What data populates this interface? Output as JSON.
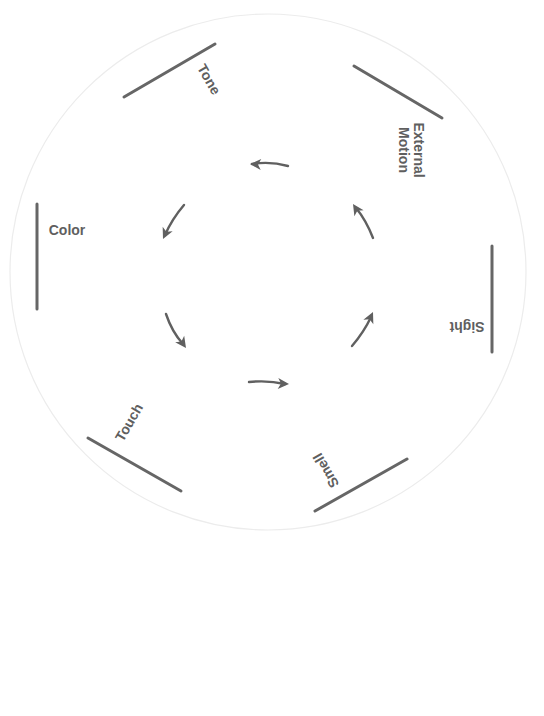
{
  "diagram": {
    "title": "",
    "colors": {
      "line": "#666666",
      "label": "#5f5f5f",
      "arrow": "#606060",
      "ring": "#ececec",
      "background": "#ffffff"
    },
    "outer_ring": {
      "cx": 268,
      "cy": 272,
      "r": 258
    },
    "spokes": [
      {
        "id": "tone",
        "label": "Tone",
        "x1": 124,
        "y1": 97,
        "x2": 215,
        "y2": 44,
        "lx": 208,
        "ly": 80,
        "rot": 60
      },
      {
        "id": "external-motion",
        "label_lines": [
          "External",
          "Motion"
        ],
        "x1": 354,
        "y1": 66,
        "x2": 442,
        "y2": 118,
        "lx": 410,
        "ly": 150,
        "rot": 90
      },
      {
        "id": "sight",
        "label": "Sight",
        "x1": 492,
        "y1": 246,
        "x2": 492,
        "y2": 352,
        "lx": 467,
        "ly": 326,
        "rot": 180
      },
      {
        "id": "smell",
        "label": "Smell",
        "x1": 315,
        "y1": 511,
        "x2": 407,
        "y2": 459,
        "lx": 327,
        "ly": 470,
        "rot": 240
      },
      {
        "id": "touch",
        "label": "Touch",
        "x1": 88,
        "y1": 438,
        "x2": 181,
        "y2": 491,
        "lx": 130,
        "ly": 423,
        "rot": -60
      },
      {
        "id": "color",
        "label": "Color",
        "x1": 37,
        "y1": 204,
        "x2": 37,
        "y2": 309,
        "lx": 67,
        "ly": 231,
        "rot": 0
      }
    ],
    "arrows": [
      {
        "id": "arrow-top",
        "d": "M288,166 Q270,161 252,164",
        "tip": [
          250,
          164
        ],
        "angle": 183
      },
      {
        "id": "arrow-upper-left",
        "d": "M184,205 Q172,219 165,235",
        "tip": [
          163,
          239
        ],
        "angle": 115
      },
      {
        "id": "arrow-lower-left",
        "d": "M166,314 Q172,332 183,344",
        "tip": [
          186,
          348
        ],
        "angle": 55
      },
      {
        "id": "arrow-bottom",
        "d": "M249,382 Q268,380 285,384",
        "tip": [
          289,
          384
        ],
        "angle": 3
      },
      {
        "id": "arrow-lower-right",
        "d": "M352,346 Q364,332 371,317",
        "tip": [
          373,
          312
        ],
        "angle": -65
      },
      {
        "id": "arrow-upper-right",
        "d": "M373,238 Q366,220 356,208",
        "tip": [
          353,
          204
        ],
        "angle": -123
      }
    ]
  }
}
